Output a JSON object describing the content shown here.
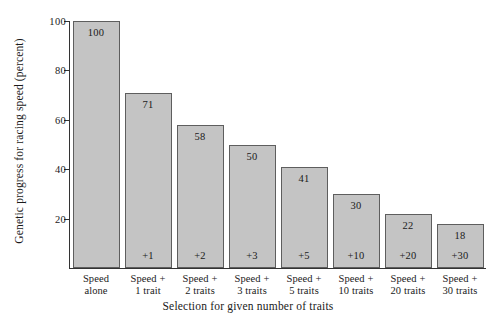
{
  "chart_data": {
    "type": "bar",
    "title": "",
    "xlabel": "Selection for given number of traits",
    "ylabel": "Genetic progress for racing speed (percent)",
    "categories": [
      "Speed alone",
      "Speed + 1 trait",
      "Speed + 2 traits",
      "Speed + 3 traits",
      "Speed + 5 traits",
      "Speed + 10 traits",
      "Speed + 20 traits",
      "Speed + 30 traits"
    ],
    "category_lines": [
      [
        "Speed",
        "alone"
      ],
      [
        "Speed +",
        "1 trait"
      ],
      [
        "Speed +",
        "2 traits"
      ],
      [
        "Speed +",
        "3 traits"
      ],
      [
        "Speed +",
        "5 traits"
      ],
      [
        "Speed +",
        "10 traits"
      ],
      [
        "Speed +",
        "20 traits"
      ],
      [
        "Speed +",
        "30 traits"
      ]
    ],
    "values": [
      100,
      71,
      58,
      50,
      41,
      30,
      22,
      18
    ],
    "value_labels": [
      "100",
      "71",
      "58",
      "50",
      "41",
      "30",
      "22",
      "18"
    ],
    "delta_labels": [
      "",
      "+1",
      "+2",
      "+3",
      "+5",
      "+10",
      "+20",
      "+30"
    ],
    "yticks": [
      20,
      40,
      60,
      80,
      100
    ],
    "ytick_labels": [
      "20",
      "40",
      "60",
      "80",
      "100"
    ],
    "ylim": [
      0,
      100
    ],
    "grid": false,
    "legend": false,
    "bar_color": "#c4c4c4",
    "bar_edge_color": "#5e5e5e",
    "axis_color": "#333333",
    "text_color": "#1a1a1a"
  }
}
